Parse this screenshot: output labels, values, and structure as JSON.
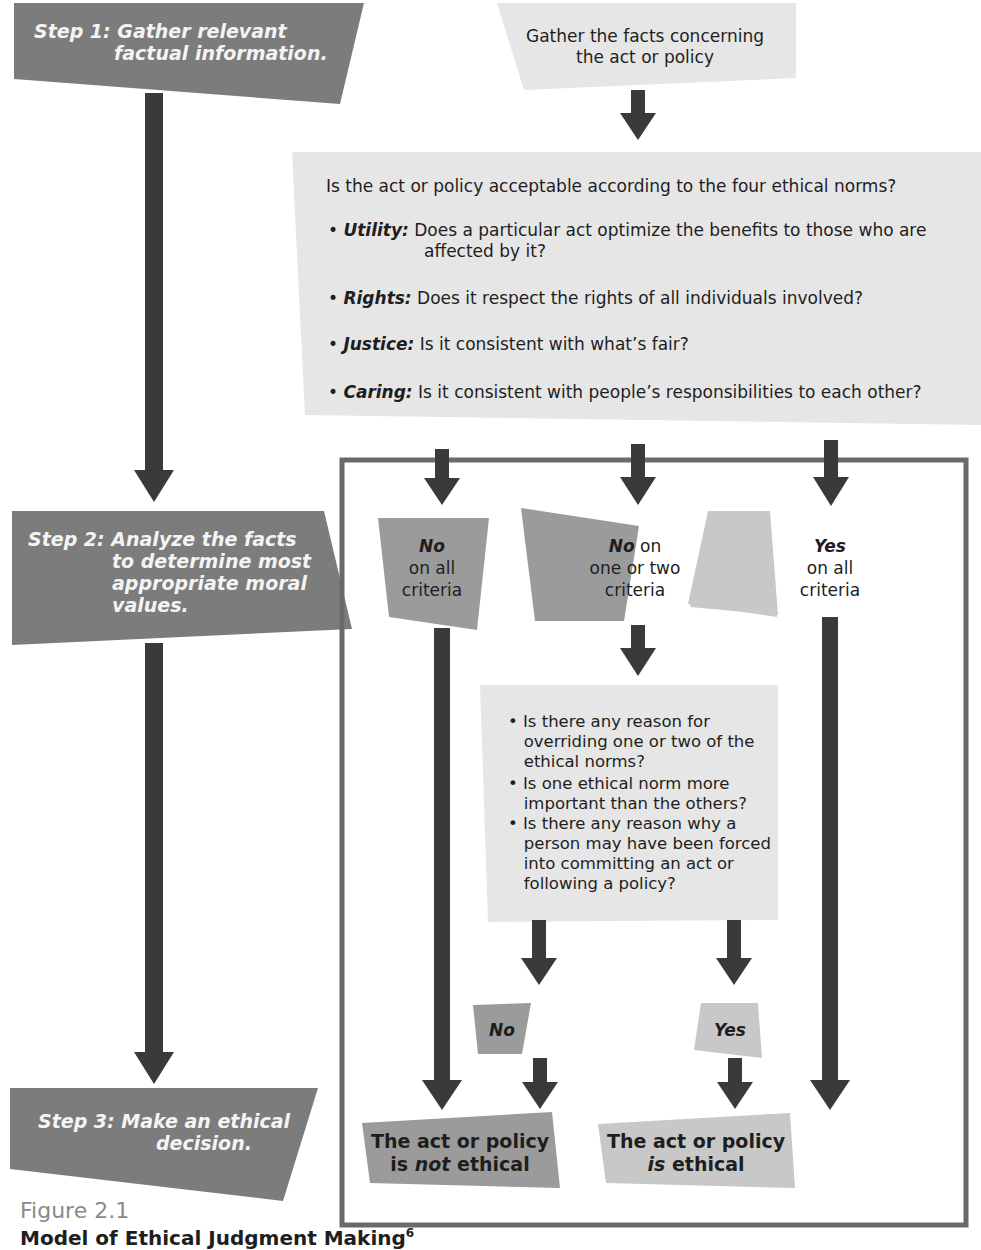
{
  "colors": {
    "dark_box": "#7c7c7c",
    "mid_box": "#9b9b9b",
    "light_box": "#c8c8c8",
    "pale_box": "#e6e6e6",
    "arrow": "#3a3a3a",
    "frame": "#6a6a6a",
    "step_text": "#f4f4f4",
    "caption_gray": "#8a8a8a"
  },
  "steps": [
    {
      "label": "Step 1:",
      "text_line1": "Gather relevant",
      "text_line2": "factual information."
    },
    {
      "label": "Step 2:",
      "text_line1": "Analyze the facts",
      "text_line2": "to determine most",
      "text_line3": "appropriate moral",
      "text_line4": "values."
    },
    {
      "label": "Step 3:",
      "text_line1": "Make an ethical",
      "text_line2": "decision."
    }
  ],
  "gather_box": {
    "line1": "Gather the facts concerning",
    "line2": "the act or policy"
  },
  "norms_box": {
    "question": "Is the act or policy acceptable according to the four ethical norms?",
    "items": [
      {
        "term": "Utility:",
        "text_line1": "Does a particular act optimize the benefits to those who are",
        "text_line2": "affected by it?"
      },
      {
        "term": "Rights:",
        "text_line1": "Does it respect the rights of all individuals involved?"
      },
      {
        "term": "Justice:",
        "text_line1": "Is it consistent with what’s fair?"
      },
      {
        "term": "Caring:",
        "text_line1": "Is it consistent with people’s responsibilities to each other?"
      }
    ]
  },
  "outcomes": [
    {
      "emph": "No",
      "rest": "",
      "line2": "on all",
      "line3": "criteria"
    },
    {
      "emph": "No",
      "rest": " on",
      "line2": "one or two",
      "line3": "criteria"
    },
    {
      "emph": "Yes",
      "rest": "",
      "line2": "on all",
      "line3": "criteria"
    }
  ],
  "override_box": {
    "bullets": [
      [
        "Is there any reason for",
        "overriding one or two of the",
        "ethical norms?"
      ],
      [
        "Is one ethical norm more",
        "important than the others?"
      ],
      [
        "Is there any reason why a",
        "person may have been forced",
        "into committing an act or",
        "following a policy?"
      ]
    ]
  },
  "small_decisions": {
    "no": "No",
    "yes": "Yes"
  },
  "results": {
    "not_ethical": {
      "line1": "The act or policy",
      "line2_a": "is ",
      "line2_em": "not",
      "line2_b": " ethical"
    },
    "ethical": {
      "line1": "The act or policy",
      "line2_em": "is",
      "line2_b": " ethical"
    }
  },
  "caption": {
    "figure": "Figure 2.1",
    "title": "Model of Ethical Judgment Making",
    "footnote": "6"
  }
}
